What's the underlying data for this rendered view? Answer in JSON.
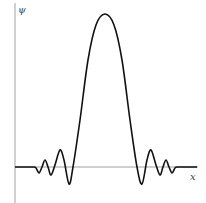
{
  "chart_data": {
    "type": "line",
    "title": "",
    "xlabel": "x",
    "ylabel": "ψ",
    "grid": false,
    "legend": null,
    "series": [
      {
        "name": "ψ(x)",
        "points_px": [
          [
            15,
            167
          ],
          [
            33,
            167
          ],
          [
            36,
            168
          ],
          [
            39,
            173
          ],
          [
            42,
            167
          ],
          [
            45,
            160
          ],
          [
            48,
            167
          ],
          [
            51,
            175
          ],
          [
            55,
            165
          ],
          [
            60,
            150
          ],
          [
            64,
            160
          ],
          [
            69,
            184
          ],
          [
            73,
            167
          ],
          [
            80,
            120
          ],
          [
            88,
            60
          ],
          [
            96,
            25
          ],
          [
            105,
            14
          ],
          [
            114,
            25
          ],
          [
            122,
            60
          ],
          [
            130,
            120
          ],
          [
            137,
            167
          ],
          [
            142,
            184
          ],
          [
            147,
            160
          ],
          [
            151,
            150
          ],
          [
            156,
            165
          ],
          [
            160,
            175
          ],
          [
            163,
            167
          ],
          [
            166,
            160
          ],
          [
            169,
            167
          ],
          [
            172,
            173
          ],
          [
            175,
            168
          ],
          [
            178,
            167
          ],
          [
            197,
            167
          ]
        ]
      }
    ],
    "axis_color": "#999999",
    "line_color": "#111111"
  },
  "labels": {
    "y_axis": "ψ",
    "x_axis": "x"
  }
}
